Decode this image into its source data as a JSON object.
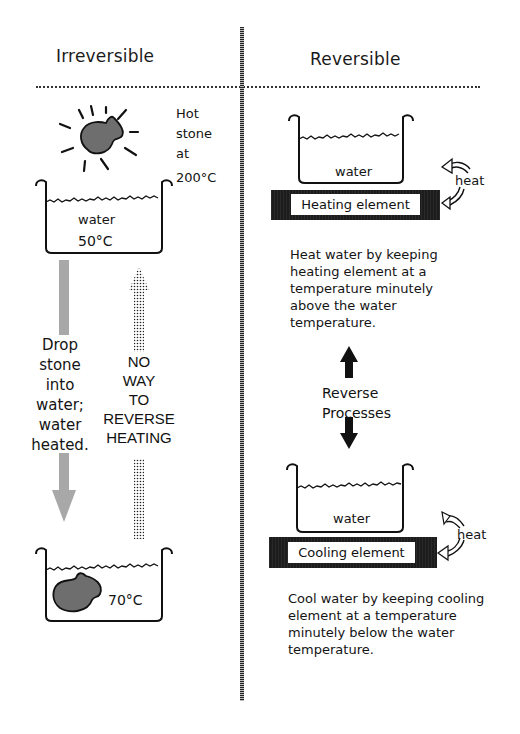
{
  "left_panel": {
    "title": "Irreversible",
    "hot_stone_label": [
      "Hot",
      "stone",
      "at",
      "200°C"
    ],
    "beaker_top": {
      "label": "water",
      "temperature": "50°C"
    },
    "drop_label": [
      "Drop",
      "stone",
      "into",
      "water;",
      "water",
      "heated."
    ],
    "no_way_label": [
      "NO",
      "WAY",
      "TO",
      "REVERSE",
      "HEATING"
    ],
    "beaker_bottom": {
      "temperature": "70°C"
    }
  },
  "right_panel": {
    "title": "Reversible",
    "heating_setup": {
      "beaker_label": "water",
      "element_label": "Heating element",
      "heat_label": "heat"
    },
    "heating_description": "Heat water by keeping heating element at a temperature minutely above the water temperature.",
    "reverse_label": [
      "Reverse",
      "Processes"
    ],
    "cooling_setup": {
      "beaker_label": "water",
      "element_label": "Cooling element",
      "heat_label": "heat"
    },
    "cooling_description": "Cool water by keeping cooling element at a temperature minutely below the water temperature."
  },
  "colors": {
    "stone": "#6e6e6e",
    "gray_arrow": "#a8a8a8",
    "element_bar": "#1c1c1c",
    "ink": "#111111"
  }
}
